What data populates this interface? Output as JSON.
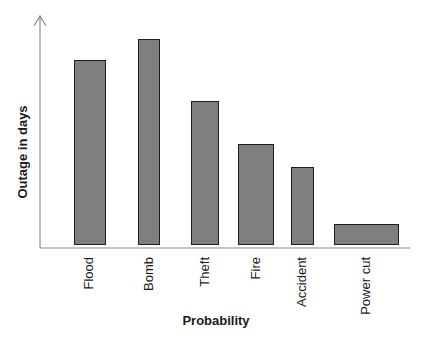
{
  "chart_data": {
    "type": "bar",
    "title": "",
    "xlabel": "Probability",
    "ylabel": "Outage in days",
    "categories": [
      "Flood",
      "Bomb",
      "Theft",
      "Fire",
      "Accident",
      "Power cut"
    ],
    "values": [
      81,
      90,
      63,
      44,
      34,
      9
    ],
    "ylim": [
      0,
      100
    ],
    "grid": false,
    "legend": null,
    "y_ticks_shown": false,
    "bar_color": "#7f7f7f",
    "bar_edge_color": "#1e1e1e",
    "note": "Values are relative (no numeric ticks shown); y-axis has an arrowhead at top."
  }
}
